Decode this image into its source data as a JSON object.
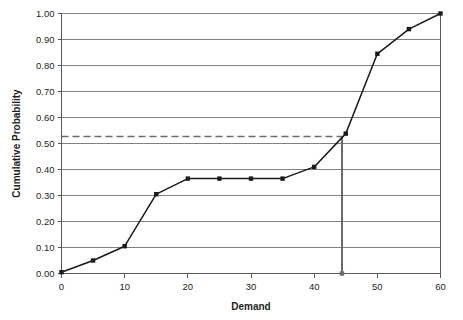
{
  "chart_data": {
    "type": "line",
    "title": "",
    "xlabel": "Demand",
    "ylabel": "Cumulative Probability",
    "x": [
      0,
      5,
      10,
      15,
      20,
      25,
      30,
      35,
      40,
      45,
      50,
      55,
      60
    ],
    "values": [
      0.005,
      0.05,
      0.105,
      0.305,
      0.365,
      0.365,
      0.365,
      0.365,
      0.41,
      0.538,
      0.845,
      0.94,
      1.0
    ],
    "series": [
      {
        "name": "Cumulative Probability",
        "values": [
          0.005,
          0.05,
          0.105,
          0.305,
          0.365,
          0.365,
          0.365,
          0.365,
          0.41,
          0.538,
          0.845,
          0.94,
          1.0
        ]
      }
    ],
    "xlim": [
      0,
      60
    ],
    "ylim": [
      0,
      1.0
    ],
    "xticks": [
      0,
      10,
      20,
      30,
      40,
      50,
      60
    ],
    "xtick_labels": [
      "0",
      "10",
      "20",
      "30",
      "40",
      "50",
      "60"
    ],
    "yticks": [
      0.0,
      0.1,
      0.2,
      0.3,
      0.4,
      0.5,
      0.6,
      0.7,
      0.8,
      0.9,
      1.0
    ],
    "ytick_labels": [
      "0.00",
      "0.10",
      "0.20",
      "0.30",
      "0.40",
      "0.50",
      "0.60",
      "0.70",
      "0.80",
      "0.90",
      "1.00"
    ],
    "grid": "horizontal",
    "legend": "none",
    "marker": "square",
    "annotations": [
      {
        "type": "reference-line-horizontal-dashed",
        "y_value": 0.527,
        "x_from": 0,
        "x_to": 44.4,
        "label": ""
      },
      {
        "type": "reference-line-vertical-solid",
        "x_value": 44.4,
        "y_from": 0.0,
        "y_to": 0.527,
        "label": ""
      }
    ],
    "colors": {
      "series": "#1a1a1a",
      "grid": "#808080",
      "axis": "#595959",
      "reference": "#6b6b6b",
      "background": "#ffffff",
      "text": "#231f20"
    }
  }
}
